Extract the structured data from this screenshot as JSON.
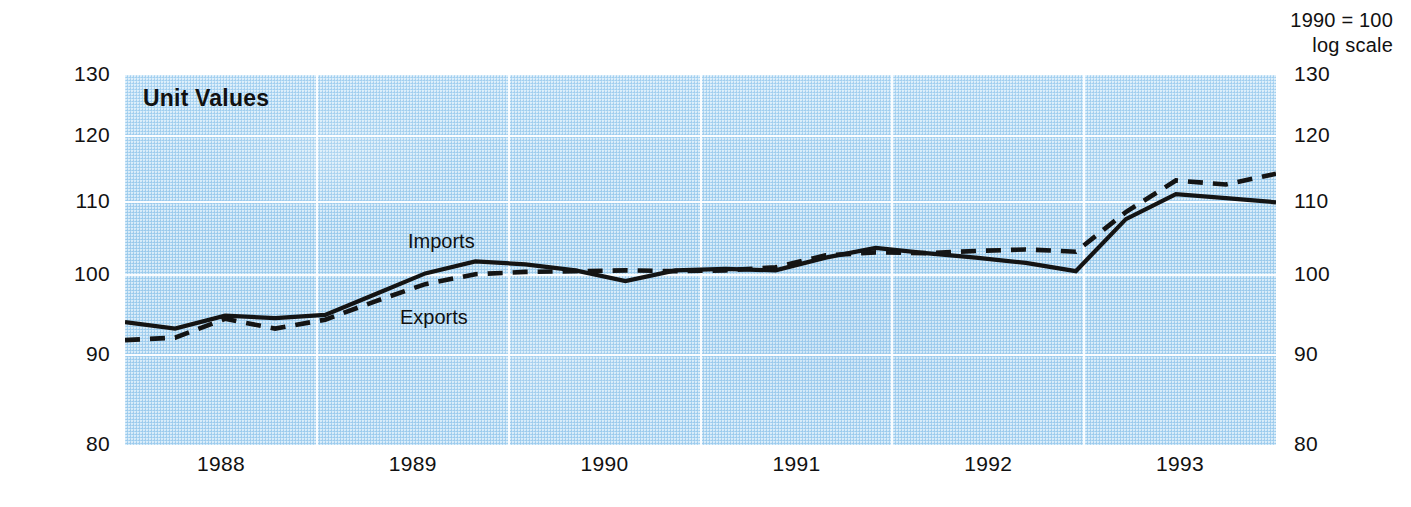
{
  "header": {
    "note_line1": "1990 = 100",
    "note_line2": "log scale"
  },
  "chart_data": {
    "type": "line",
    "title": "Unit Values",
    "subtitle": "1990 = 100, log scale",
    "xlabel": "",
    "ylabel": "",
    "scale": "log",
    "grid": true,
    "legend_position": "inline-annotation",
    "index_base": "1990 = 100",
    "background_color": "#aed8f4",
    "line_color": "#141414",
    "ylim": [
      80,
      130
    ],
    "yticks": [
      130,
      120,
      110,
      100,
      90,
      80
    ],
    "ytick_labels_left": [
      "130",
      "120",
      "110",
      "100",
      "90",
      "80"
    ],
    "ytick_labels_right": [
      "130",
      "120",
      "110",
      "100",
      "90",
      "80"
    ],
    "xlim": [
      "1987Q4",
      "1993Q3"
    ],
    "xticks": [
      "1988",
      "1989",
      "1990",
      "1991",
      "1992",
      "1993"
    ],
    "x_quarters": [
      "1987Q4",
      "1988Q1",
      "1988Q2",
      "1988Q3",
      "1988Q4",
      "1989Q1",
      "1989Q2",
      "1989Q3",
      "1989Q4",
      "1990Q1",
      "1990Q2",
      "1990Q3",
      "1990Q4",
      "1991Q1",
      "1991Q2",
      "1991Q3",
      "1991Q4",
      "1992Q1",
      "1992Q2",
      "1992Q3",
      "1992Q4",
      "1993Q1",
      "1993Q2"
    ],
    "series": [
      {
        "name": "Imports",
        "style": "solid",
        "values": [
          94.0,
          93.2,
          94.8,
          94.5,
          94.9,
          97.5,
          100.2,
          101.8,
          101.4,
          100.6,
          99.2,
          100.6,
          100.8,
          100.6,
          102.3,
          103.6,
          102.9,
          102.3,
          101.6,
          100.5,
          107.6,
          111.2,
          110.6,
          110.0
        ]
      },
      {
        "name": "Exports",
        "style": "dashed",
        "values": [
          91.8,
          92.1,
          94.4,
          93.2,
          94.3,
          96.6,
          98.8,
          100.1,
          100.4,
          100.5,
          100.6,
          100.5,
          100.6,
          101.0,
          102.6,
          103.0,
          102.9,
          103.2,
          103.4,
          103.1,
          108.6,
          113.2,
          112.6,
          114.2
        ]
      }
    ],
    "annotations": [
      {
        "text": "Imports",
        "series": "Imports"
      },
      {
        "text": "Exports",
        "series": "Exports"
      }
    ]
  }
}
